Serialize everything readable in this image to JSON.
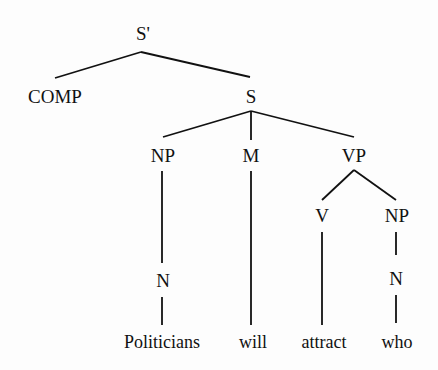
{
  "diagram": {
    "type": "syntax-tree",
    "nodes": {
      "sbar": "S'",
      "comp": "COMP",
      "s": "S",
      "np_subj": "NP",
      "m": "M",
      "vp": "VP",
      "v": "V",
      "np_obj": "NP",
      "n_subj": "N",
      "n_obj": "N"
    },
    "words": {
      "politicians": "Politicians",
      "will": "will",
      "attract": "attract",
      "who": "who"
    },
    "colors": {
      "line": "#111111",
      "text": "#111111",
      "background": "#fdfdfd"
    }
  }
}
